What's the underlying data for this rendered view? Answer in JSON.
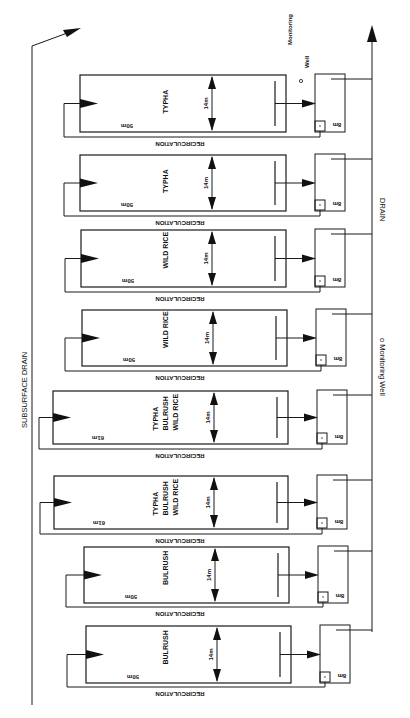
{
  "diagram": {
    "labels": {
      "subsurface_drain": "SUBSURFACE DRAIN",
      "drain": "DRAIN",
      "monitoring_well_side": "o Monitoring Well",
      "monitoring_well_top_1": "Monitoring",
      "monitoring_well_top_2": "Well",
      "monitoring_well_dot": "o",
      "recirculation": "RECIRCULATION",
      "width": "14m",
      "box_size": "8m"
    },
    "cells": [
      {
        "id": 1,
        "length": "50m",
        "plants": [
          "TYPHA"
        ],
        "top": 75,
        "bottom": 132,
        "left": 80,
        "right": 286,
        "recirc_y": 137,
        "recirc_x": 64
      },
      {
        "id": 2,
        "length": "50m",
        "plants": [
          "TYPHA"
        ],
        "top": 155,
        "bottom": 211,
        "left": 80,
        "right": 286,
        "recirc_y": 216,
        "recirc_x": 64
      },
      {
        "id": 3,
        "length": "50m",
        "plants": [
          "WILD RICE"
        ],
        "top": 230,
        "bottom": 287,
        "left": 81,
        "right": 286,
        "recirc_y": 292,
        "recirc_x": 65
      },
      {
        "id": 4,
        "length": "50m",
        "plants": [
          "WILD RICE"
        ],
        "top": 310,
        "bottom": 366,
        "left": 82,
        "right": 287,
        "recirc_y": 371,
        "recirc_x": 65
      },
      {
        "id": 5,
        "length": "61m",
        "plants": [
          "TYPHA",
          "BULRUSH",
          "WILD RICE"
        ],
        "top": 391,
        "bottom": 444,
        "left": 53,
        "right": 288,
        "recirc_y": 449,
        "recirc_x": 39
      },
      {
        "id": 6,
        "length": "61m",
        "plants": [
          "TYPHA",
          "BULRUSH",
          "WILD RICE"
        ],
        "top": 476,
        "bottom": 529,
        "left": 54,
        "right": 288,
        "recirc_y": 534,
        "recirc_x": 40
      },
      {
        "id": 7,
        "length": "50m",
        "plants": [
          "BULRUSH"
        ],
        "top": 547,
        "bottom": 603,
        "left": 84,
        "right": 289,
        "recirc_y": 607,
        "recirc_x": 66
      },
      {
        "id": 8,
        "length": "50m",
        "plants": [
          "BULRUSH"
        ],
        "top": 626,
        "bottom": 683,
        "left": 86,
        "right": 291,
        "recirc_y": 687,
        "recirc_x": 67
      }
    ]
  }
}
